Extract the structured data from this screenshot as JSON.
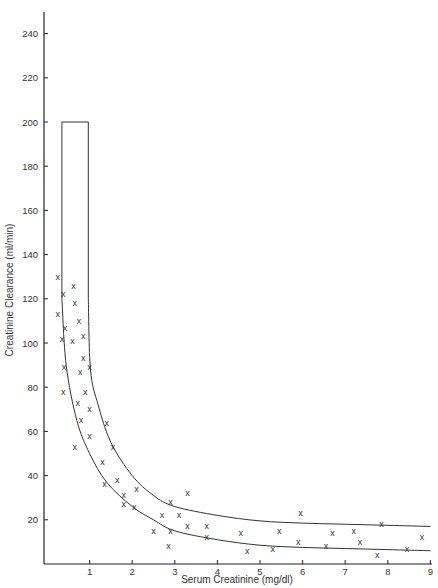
{
  "chart_data": {
    "type": "scatter",
    "title": "",
    "xlabel": "Serum Creatinine (mg/dl)",
    "ylabel": "Creatinine Clearance (ml/min)",
    "xlim": [
      0,
      9
    ],
    "ylim": [
      0,
      250
    ],
    "x_ticks": [
      1,
      2,
      3,
      4,
      5,
      6,
      7,
      8,
      9
    ],
    "y_ticks": [
      20,
      40,
      60,
      80,
      100,
      120,
      140,
      160,
      180,
      200,
      220,
      240
    ],
    "grid": false,
    "legend": null,
    "series": [
      {
        "name": "Patients",
        "marker": "x",
        "points": [
          [
            0.25,
            130
          ],
          [
            0.25,
            113
          ],
          [
            0.38,
            122
          ],
          [
            0.35,
            102
          ],
          [
            0.42,
            107
          ],
          [
            0.4,
            89
          ],
          [
            0.38,
            78
          ],
          [
            0.62,
            126
          ],
          [
            0.65,
            118
          ],
          [
            0.75,
            110
          ],
          [
            0.6,
            101
          ],
          [
            0.85,
            103
          ],
          [
            0.85,
            93
          ],
          [
            0.78,
            87
          ],
          [
            0.65,
            53
          ],
          [
            1.0,
            89
          ],
          [
            0.9,
            78
          ],
          [
            0.72,
            73
          ],
          [
            1.0,
            70
          ],
          [
            0.8,
            65
          ],
          [
            1.0,
            58
          ],
          [
            1.4,
            64
          ],
          [
            1.55,
            53
          ],
          [
            1.3,
            46
          ],
          [
            1.35,
            36
          ],
          [
            1.65,
            38
          ],
          [
            1.8,
            31
          ],
          [
            1.8,
            27
          ],
          [
            2.1,
            34
          ],
          [
            2.05,
            26
          ],
          [
            2.5,
            15
          ],
          [
            2.7,
            22
          ],
          [
            2.9,
            28
          ],
          [
            2.9,
            15
          ],
          [
            2.85,
            8
          ],
          [
            3.1,
            22
          ],
          [
            3.3,
            32
          ],
          [
            3.3,
            17
          ],
          [
            3.75,
            17
          ],
          [
            3.75,
            12
          ],
          [
            4.55,
            14
          ],
          [
            4.7,
            6
          ],
          [
            5.3,
            7
          ],
          [
            5.45,
            15
          ],
          [
            5.9,
            10
          ],
          [
            5.95,
            23
          ],
          [
            6.55,
            8
          ],
          [
            6.7,
            14
          ],
          [
            7.2,
            15
          ],
          [
            7.35,
            10
          ],
          [
            7.75,
            4
          ],
          [
            7.85,
            18
          ],
          [
            8.45,
            7
          ],
          [
            8.8,
            12
          ]
        ]
      }
    ],
    "bands": {
      "upper_limit": {
        "name": "Upper limit",
        "points": [
          [
            0.97,
            200
          ],
          [
            0.97,
            120
          ],
          [
            1.02,
            88
          ],
          [
            1.2,
            72
          ],
          [
            1.5,
            55
          ],
          [
            2.0,
            40
          ],
          [
            2.5,
            31
          ],
          [
            3.0,
            26
          ],
          [
            4.0,
            22
          ],
          [
            5.0,
            19.5
          ],
          [
            6.0,
            18.5
          ],
          [
            7.0,
            18
          ],
          [
            8.0,
            17.5
          ],
          [
            9.0,
            17
          ]
        ]
      },
      "lower_limit": {
        "name": "Lower limit",
        "points": [
          [
            0.35,
            200
          ],
          [
            0.35,
            120
          ],
          [
            0.45,
            90
          ],
          [
            0.7,
            65
          ],
          [
            1.0,
            50
          ],
          [
            1.4,
            37
          ],
          [
            2.0,
            26
          ],
          [
            2.5,
            20
          ],
          [
            3.0,
            15
          ],
          [
            4.0,
            11
          ],
          [
            5.0,
            8.5
          ],
          [
            6.0,
            7.5
          ],
          [
            7.0,
            7
          ],
          [
            8.0,
            6.5
          ],
          [
            9.0,
            6
          ]
        ]
      },
      "top_cap": {
        "y": 200,
        "x_from": 0.35,
        "x_to": 0.97
      }
    }
  }
}
